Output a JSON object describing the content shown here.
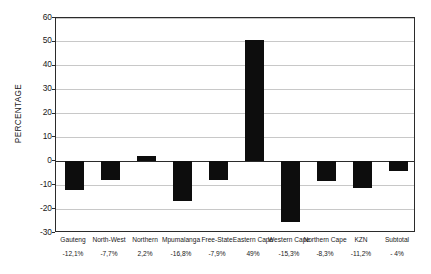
{
  "chart_data": {
    "type": "bar",
    "title": "",
    "xlabel": "",
    "ylabel": "PERCENTAGE",
    "ylim": [
      -30,
      60
    ],
    "yticks": [
      60,
      50,
      40,
      30,
      20,
      10,
      0,
      -10,
      -20,
      -30
    ],
    "ytick_labels": [
      "60",
      "50",
      "40",
      "30",
      "20",
      "10",
      "0",
      "-10",
      "-20",
      "-30"
    ],
    "grid": true,
    "legend": "none",
    "bar_color": "#0d0d0d",
    "categories": [
      "Gauteng",
      "North-West",
      "Northern",
      "Mpumalanga",
      "Free-State",
      "Eastern Cape",
      "Western Cape",
      "Northern Cape",
      "KZN",
      "Subtotal"
    ],
    "values": [
      -12.1,
      -7.7,
      2.2,
      -16.8,
      -7.9,
      51,
      -25.3,
      -8.3,
      -11.2,
      -4
    ],
    "value_labels": [
      "-12,1%",
      "-7,7%",
      "2,2%",
      "-16,8%",
      "-7,9%",
      "49%",
      "-15,3%",
      "-8,3%",
      "-11,2%",
      "- 4%"
    ]
  },
  "caption": {
    "text": ""
  }
}
